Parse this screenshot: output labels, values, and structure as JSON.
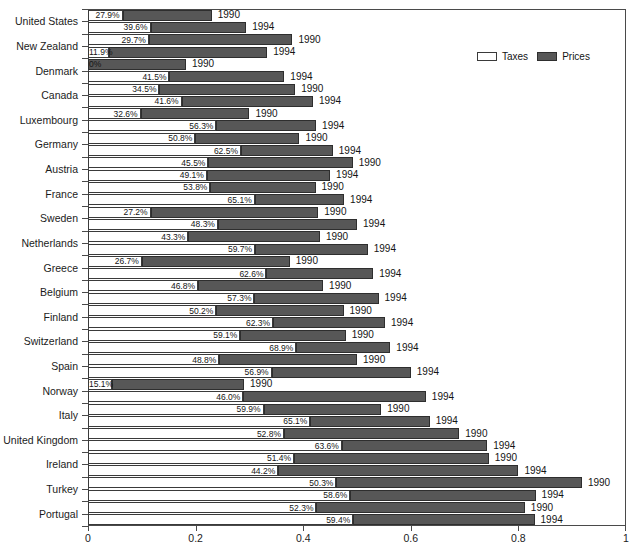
{
  "chart_data": {
    "type": "bar",
    "orientation": "horizontal",
    "stacked": true,
    "title": "",
    "xlabel": "",
    "ylabel": "",
    "xlim": [
      0,
      1
    ],
    "xticks": [
      "0",
      "0.2",
      "0.4",
      "0.6",
      "0.8",
      "1"
    ],
    "xtick_values": [
      0,
      0.2,
      0.4,
      0.6,
      0.8,
      1
    ],
    "grid": false,
    "legend": {
      "position": "top-right",
      "entries": [
        {
          "label": "Taxes",
          "color": "#ffffff",
          "border": "#3a3a3a"
        },
        {
          "label": "Prices",
          "color": "#575757",
          "border": "#2e2e2e"
        }
      ]
    },
    "series": [
      {
        "name": "Taxes",
        "color": "#ffffff"
      },
      {
        "name": "Prices",
        "color": "#575757"
      }
    ],
    "categories": [
      "United States",
      "New Zealand",
      "Denmark",
      "Canada",
      "Luxembourg",
      "Germany",
      "Austria",
      "France",
      "Sweden",
      "Netherlands",
      "Greece",
      "Belgium",
      "Finland",
      "Switzerland",
      "Spain",
      "Norway",
      "Italy",
      "United Kingdom",
      "Ireland",
      "Turkey",
      "Portugal"
    ],
    "bars": [
      {
        "category": "United States",
        "year": "1990",
        "taxes_pct": "27.9%",
        "taxes_share": 0.279,
        "total": 0.23
      },
      {
        "category": "United States",
        "year": "1994",
        "taxes_pct": "39.6%",
        "taxes_share": 0.396,
        "total": 0.294
      },
      {
        "category": "New Zealand",
        "year": "1990",
        "taxes_pct": "29.7%",
        "taxes_share": 0.297,
        "total": 0.38
      },
      {
        "category": "New Zealand",
        "year": "1994",
        "taxes_pct": "11.9%",
        "taxes_share": 0.119,
        "total": 0.333
      },
      {
        "category": "Denmark",
        "year": "1990",
        "taxes_pct": "0%",
        "taxes_share": 0.0,
        "total": 0.182
      },
      {
        "category": "Denmark",
        "year": "1994",
        "taxes_pct": "41.5%",
        "taxes_share": 0.415,
        "total": 0.365
      },
      {
        "category": "Canada",
        "year": "1990",
        "taxes_pct": "34.5%",
        "taxes_share": 0.345,
        "total": 0.385
      },
      {
        "category": "Canada",
        "year": "1994",
        "taxes_pct": "41.6%",
        "taxes_share": 0.416,
        "total": 0.418
      },
      {
        "category": "Luxembourg",
        "year": "1990",
        "taxes_pct": "32.6%",
        "taxes_share": 0.326,
        "total": 0.3
      },
      {
        "category": "Luxembourg",
        "year": "1994",
        "taxes_pct": "56.3%",
        "taxes_share": 0.563,
        "total": 0.424
      },
      {
        "category": "Germany",
        "year": "1990",
        "taxes_pct": "50.8%",
        "taxes_share": 0.508,
        "total": 0.393
      },
      {
        "category": "Germany",
        "year": "1994",
        "taxes_pct": "62.5%",
        "taxes_share": 0.625,
        "total": 0.455
      },
      {
        "category": "Austria",
        "year": "1990",
        "taxes_pct": "45.5%",
        "taxes_share": 0.455,
        "total": 0.492
      },
      {
        "category": "Austria",
        "year": "1994",
        "taxes_pct": "49.1%",
        "taxes_share": 0.491,
        "total": 0.45
      },
      {
        "category": "France",
        "year": "1990",
        "taxes_pct": "53.8%",
        "taxes_share": 0.538,
        "total": 0.423
      },
      {
        "category": "France",
        "year": "1994",
        "taxes_pct": "65.1%",
        "taxes_share": 0.651,
        "total": 0.476
      },
      {
        "category": "Sweden",
        "year": "1990",
        "taxes_pct": "27.2%",
        "taxes_share": 0.272,
        "total": 0.428
      },
      {
        "category": "Sweden",
        "year": "1994",
        "taxes_pct": "48.3%",
        "taxes_share": 0.483,
        "total": 0.5
      },
      {
        "category": "Netherlands",
        "year": "1990",
        "taxes_pct": "43.3%",
        "taxes_share": 0.433,
        "total": 0.431
      },
      {
        "category": "Netherlands",
        "year": "1994",
        "taxes_pct": "59.7%",
        "taxes_share": 0.597,
        "total": 0.52
      },
      {
        "category": "Greece",
        "year": "1990",
        "taxes_pct": "26.7%",
        "taxes_share": 0.267,
        "total": 0.375
      },
      {
        "category": "Greece",
        "year": "1994",
        "taxes_pct": "62.6%",
        "taxes_share": 0.626,
        "total": 0.53
      },
      {
        "category": "Belgium",
        "year": "1990",
        "taxes_pct": "46.8%",
        "taxes_share": 0.468,
        "total": 0.437
      },
      {
        "category": "Belgium",
        "year": "1994",
        "taxes_pct": "57.3%",
        "taxes_share": 0.573,
        "total": 0.54
      },
      {
        "category": "Finland",
        "year": "1990",
        "taxes_pct": "50.2%",
        "taxes_share": 0.502,
        "total": 0.475
      },
      {
        "category": "Finland",
        "year": "1994",
        "taxes_pct": "62.3%",
        "taxes_share": 0.623,
        "total": 0.552
      },
      {
        "category": "Switzerland",
        "year": "1990",
        "taxes_pct": "59.1%",
        "taxes_share": 0.591,
        "total": 0.479
      },
      {
        "category": "Switzerland",
        "year": "1994",
        "taxes_pct": "68.9%",
        "taxes_share": 0.689,
        "total": 0.562
      },
      {
        "category": "Spain",
        "year": "1990",
        "taxes_pct": "48.8%",
        "taxes_share": 0.488,
        "total": 0.5
      },
      {
        "category": "Spain",
        "year": "1994",
        "taxes_pct": "56.9%",
        "taxes_share": 0.569,
        "total": 0.6
      },
      {
        "category": "Norway",
        "year": "1990",
        "taxes_pct": "15.1%",
        "taxes_share": 0.151,
        "total": 0.29
      },
      {
        "category": "Norway",
        "year": "1994",
        "taxes_pct": "46.0%",
        "taxes_share": 0.46,
        "total": 0.628
      },
      {
        "category": "Italy",
        "year": "1990",
        "taxes_pct": "59.9%",
        "taxes_share": 0.599,
        "total": 0.545
      },
      {
        "category": "Italy",
        "year": "1994",
        "taxes_pct": "65.1%",
        "taxes_share": 0.651,
        "total": 0.635
      },
      {
        "category": "United Kingdom",
        "year": "1990",
        "taxes_pct": "52.8%",
        "taxes_share": 0.528,
        "total": 0.69
      },
      {
        "category": "United Kingdom",
        "year": "1994",
        "taxes_pct": "63.6%",
        "taxes_share": 0.636,
        "total": 0.742
      },
      {
        "category": "Ireland",
        "year": "1990",
        "taxes_pct": "51.4%",
        "taxes_share": 0.514,
        "total": 0.745
      },
      {
        "category": "Ireland",
        "year": "1994",
        "taxes_pct": "44.2%",
        "taxes_share": 0.442,
        "total": 0.8
      },
      {
        "category": "Turkey",
        "year": "1990",
        "taxes_pct": "50.3%",
        "taxes_share": 0.503,
        "total": 0.918
      },
      {
        "category": "Turkey",
        "year": "1994",
        "taxes_pct": "58.6%",
        "taxes_share": 0.586,
        "total": 0.832
      },
      {
        "category": "Portugal",
        "year": "1990",
        "taxes_pct": "52.3%",
        "taxes_share": 0.523,
        "total": 0.812
      },
      {
        "category": "Portugal",
        "year": "1994",
        "taxes_pct": "59.4%",
        "taxes_share": 0.594,
        "total": 0.83
      }
    ]
  }
}
